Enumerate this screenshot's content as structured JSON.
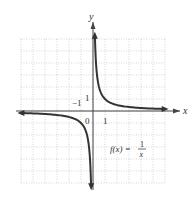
{
  "chart_data": {
    "type": "line",
    "title": "",
    "function_label": "f(x) = 1/x",
    "function_label_parts": {
      "lhs": "f(x) =",
      "num": "1",
      "den": "x"
    },
    "xlabel": "x",
    "ylabel": "y",
    "tick_labels": {
      "origin": "0",
      "x_one": "1",
      "y_one": "1",
      "neg_one": "−1"
    },
    "xlim": [
      -6,
      6
    ],
    "ylim": [
      -6,
      6
    ],
    "grid": true,
    "series": [
      {
        "name": "f(x) = 1/x (x<0)",
        "x": [
          -6,
          -5,
          -4,
          -3,
          -2,
          -1,
          -0.5,
          -0.25,
          -0.17
        ],
        "y": [
          -0.17,
          -0.2,
          -0.25,
          -0.33,
          -0.5,
          -1,
          -2,
          -4,
          -6
        ]
      },
      {
        "name": "f(x) = 1/x (x>0)",
        "x": [
          0.17,
          0.25,
          0.5,
          1,
          2,
          3,
          4,
          5,
          6
        ],
        "y": [
          6,
          4,
          2,
          1,
          0.5,
          0.33,
          0.25,
          0.2,
          0.17
        ]
      }
    ],
    "asymptotes": {
      "vertical": "x = 0",
      "horizontal": "y = 0"
    }
  },
  "colors": {
    "curve": "#333333",
    "axis": "#444444",
    "grid": "#bbbbbb"
  }
}
